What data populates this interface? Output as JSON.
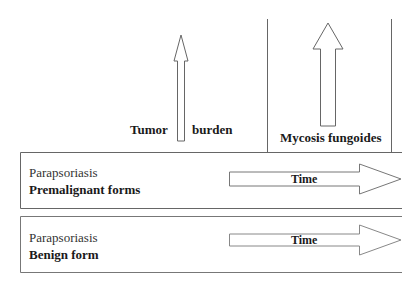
{
  "diagram": {
    "upper_region": {
      "tumor_label_left": "Tumor",
      "tumor_label_right": "burden",
      "mycosis_label": "Mycosis fungoides"
    },
    "boxes": [
      {
        "title": "Parapsoriasis",
        "subtitle": "Premalignant forms",
        "arrow_label": "Time"
      },
      {
        "title": "Parapsoriasis",
        "subtitle": "Benign form",
        "arrow_label": "Time"
      }
    ],
    "colors": {
      "line": "#555555",
      "text": "#1a1a1a",
      "background": "#ffffff"
    }
  }
}
